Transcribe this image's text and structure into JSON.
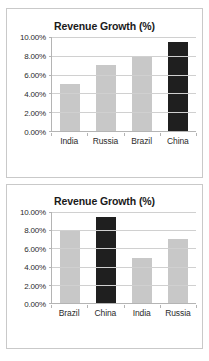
{
  "charts": [
    {
      "title": "Revenue Growth (%)",
      "categories": [
        "India",
        "Russia",
        "Brazil",
        "China"
      ],
      "values": [
        5.0,
        7.0,
        8.0,
        9.5
      ],
      "value_labels": [
        "5.00%",
        "7.00%",
        "8.00%",
        "9.50%"
      ],
      "highlight_index": 3,
      "ticks": [
        "10.00%",
        "8.00%",
        "6.00%",
        "4.00%",
        "2.00%",
        "0.00%"
      ],
      "tick_values": [
        10,
        8,
        6,
        4,
        2,
        0
      ]
    },
    {
      "title": "Revenue Growth (%)",
      "categories": [
        "Brazil",
        "China",
        "India",
        "Russia"
      ],
      "values": [
        8.0,
        9.5,
        5.0,
        7.0
      ],
      "value_labels": [
        "8.00%",
        "9.50%",
        "5.00%",
        "7.00%"
      ],
      "highlight_index": 1,
      "ticks": [
        "10.00%",
        "8.00%",
        "6.00%",
        "4.00%",
        "2.00%",
        "0.00%"
      ],
      "tick_values": [
        10,
        8,
        6,
        4,
        2,
        0
      ]
    }
  ],
  "colors": {
    "bar": "#c8c8c8",
    "bar_highlight": "#1f1f1f",
    "gridline": "#d0d0d0",
    "axis": "#b4b4b4",
    "border": "#c9c9c9",
    "text": "#2b2b2b",
    "title": "#1a1a1a",
    "background": "#ffffff"
  },
  "chart_data": [
    {
      "type": "bar",
      "title": "Revenue Growth (%)",
      "categories": [
        "India",
        "Russia",
        "Brazil",
        "China"
      ],
      "values": [
        5.0,
        7.0,
        8.0,
        9.5
      ],
      "series": [
        {
          "name": "Revenue Growth (%)",
          "values": [
            5.0,
            7.0,
            8.0,
            9.5
          ]
        }
      ],
      "xlabel": "",
      "ylabel": "",
      "ylim": [
        0,
        10
      ],
      "ytick_values": [
        0,
        2,
        4,
        6,
        8,
        10
      ],
      "ytick_labels": [
        "0.00%",
        "2.00%",
        "4.00%",
        "6.00%",
        "8.00%",
        "10.00%"
      ],
      "grid": true,
      "legend": false,
      "sorted_by": "value ascending",
      "highlighted_category": "China",
      "bar_colors": [
        "#c8c8c8",
        "#c8c8c8",
        "#c8c8c8",
        "#1f1f1f"
      ]
    },
    {
      "type": "bar",
      "title": "Revenue Growth (%)",
      "categories": [
        "Brazil",
        "China",
        "India",
        "Russia"
      ],
      "values": [
        8.0,
        9.5,
        5.0,
        7.0
      ],
      "series": [
        {
          "name": "Revenue Growth (%)",
          "values": [
            8.0,
            9.5,
            5.0,
            7.0
          ]
        }
      ],
      "xlabel": "",
      "ylabel": "",
      "ylim": [
        0,
        10
      ],
      "ytick_values": [
        0,
        2,
        4,
        6,
        8,
        10
      ],
      "ytick_labels": [
        "0.00%",
        "2.00%",
        "4.00%",
        "6.00%",
        "8.00%",
        "10.00%"
      ],
      "grid": true,
      "legend": false,
      "sorted_by": "category alphabetical",
      "highlighted_category": "China",
      "bar_colors": [
        "#c8c8c8",
        "#1f1f1f",
        "#c8c8c8",
        "#c8c8c8"
      ]
    }
  ]
}
